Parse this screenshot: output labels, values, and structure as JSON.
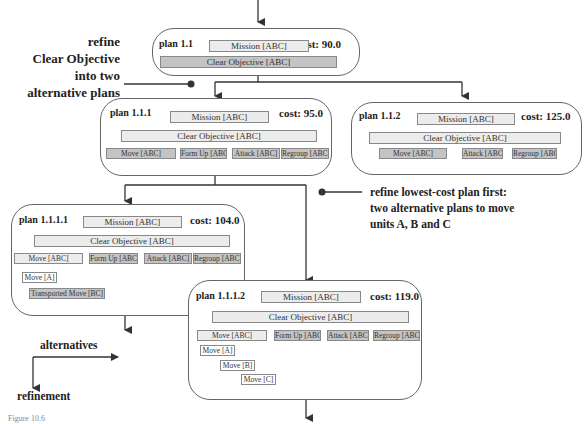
{
  "annotations": {
    "left": [
      "refine",
      "Clear Objective",
      "into two",
      "alternative plans"
    ],
    "right": [
      "refine lowest-cost plan first:",
      "two alternative plans to move",
      "units A, B and C"
    ],
    "legend_alternatives": "alternatives",
    "legend_refinement": "refinement",
    "figure_caption": "Figure 10.6"
  },
  "plans": {
    "p11": {
      "label": "plan 1.1",
      "cost": "cost: 90.0",
      "mission": "Mission [ABC]",
      "objective": "Clear Objective [ABC]"
    },
    "p111": {
      "label": "plan 1.1.1",
      "cost": "cost: 95.0",
      "mission": "Mission [ABC]",
      "objective": "Clear Objective [ABC]",
      "tasks": [
        "Move [ABC]",
        "Form Up [ABC]",
        "Attack [ABC]",
        "Regroup [ABC]"
      ]
    },
    "p112": {
      "label": "plan 1.1.2",
      "cost": "cost: 125.0",
      "mission": "Mission [ABC]",
      "objective": "Clear Objective [ABC]",
      "tasks": [
        "Move [ABC]",
        "Attack [ABC]",
        "Regroup [ABC]"
      ]
    },
    "p1111": {
      "label": "plan 1.1.1.1",
      "cost": "cost: 104.0",
      "mission": "Mission [ABC]",
      "objective": "Clear Objective [ABC]",
      "tasks": [
        "Move [ABC]",
        "Form Up [ABC]",
        "Attack [ABC]",
        "Regroup [ABC]"
      ],
      "subtasks": [
        "Move [A]",
        "Transported Move [BC]"
      ]
    },
    "p1112": {
      "label": "plan 1.1.1.2",
      "cost": "cost: 119.0",
      "mission": "Mission [ABC]",
      "objective": "Clear Objective [ABC]",
      "tasks": [
        "Move [ABC]",
        "Form Up [ABC]",
        "Attack [ABC]",
        "Regroup [ABC]"
      ],
      "subtasks": [
        "Move [A]",
        "Move [B]",
        "Move [C]"
      ]
    }
  },
  "colors": {
    "light_task": "#ececec",
    "dark_task": "#c4c4c4",
    "line": "#333333",
    "border": "#666666"
  }
}
